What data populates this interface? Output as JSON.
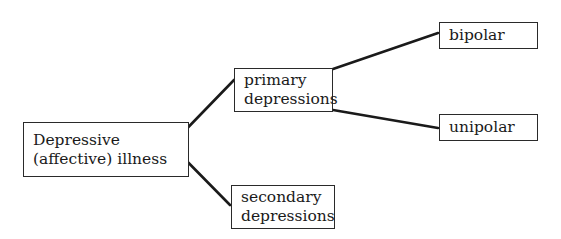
{
  "diagram": {
    "type": "tree",
    "nodes": {
      "root": {
        "label": "Depressive (affective) illness",
        "lines": [
          "Depressive",
          "(affective) illness"
        ]
      },
      "primary": {
        "label": "primary depressions",
        "lines": [
          "primary",
          "depressions"
        ]
      },
      "secondary": {
        "label": "secondary depressions",
        "lines": [
          "secondary",
          "depressions"
        ]
      },
      "bipolar": {
        "label": "bipolar",
        "lines": [
          "bipolar"
        ]
      },
      "unipolar": {
        "label": "unipolar",
        "lines": [
          "unipolar"
        ]
      }
    },
    "edges": [
      {
        "from": "root",
        "to": "primary"
      },
      {
        "from": "root",
        "to": "secondary"
      },
      {
        "from": "primary",
        "to": "bipolar"
      },
      {
        "from": "primary",
        "to": "unipolar"
      }
    ],
    "colors": {
      "line": "#1a1a1a",
      "border": "#2a2a2a",
      "background": "#ffffff"
    }
  }
}
